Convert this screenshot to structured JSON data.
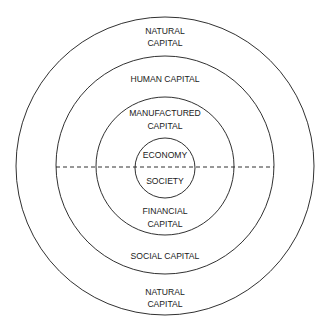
{
  "diagram": {
    "colors": {
      "stroke": "#1a1a1a",
      "text": "#1a1a1a",
      "background": "#ffffff"
    },
    "rings": [
      {
        "name": "natural-capital",
        "cx": 165,
        "cy": 166,
        "r": 149
      },
      {
        "name": "human-social-capital",
        "cx": 165,
        "cy": 165,
        "r": 109
      },
      {
        "name": "manufactured-financial-capital",
        "cx": 165,
        "cy": 166,
        "r": 69
      },
      {
        "name": "economy-society",
        "cx": 165,
        "cy": 168,
        "r": 30
      }
    ],
    "divider": {
      "x1": 56,
      "x2": 274,
      "y": 167,
      "dash": "4 3"
    },
    "upper_labels": {
      "natural_capital": [
        "NATURAL",
        "CAPITAL"
      ],
      "human_capital": "HUMAN CAPITAL",
      "manufactured_capital": [
        "MANUFACTURED",
        "CAPITAL"
      ],
      "economy": "ECONOMY"
    },
    "lower_labels": {
      "society": "SOCIETY",
      "financial_capital": [
        "FINANCIAL",
        "CAPITAL"
      ],
      "social_capital": "SOCIAL CAPITAL",
      "natural_capital": [
        "NATURAL",
        "CAPITAL"
      ]
    }
  }
}
